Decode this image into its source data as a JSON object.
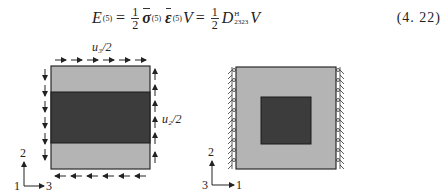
{
  "equation": {
    "lhs": "E",
    "lhs_superscript": "(5)",
    "half_numerator": "1",
    "half_denominator": "2",
    "sigma": "σ",
    "sigma_superscript": "(5)",
    "epsilon": "ε",
    "epsilon_superscript": "(5)",
    "volume": "V",
    "stiffness": "D",
    "stiffness_superscript": "H",
    "stiffness_subscript": "2323",
    "equals": "=",
    "number": "(4. 22)"
  },
  "figure_left": {
    "top_label": "u₃/2",
    "right_label": "u₂/2",
    "axes": {
      "vertical": "2",
      "origin": "1",
      "horizontal": "3"
    },
    "colors": {
      "light": "#b4b4b4",
      "dark": "#3c3c3c",
      "border": "#2a2a2a"
    }
  },
  "figure_right": {
    "axes": {
      "vertical": "2",
      "origin": "3",
      "horizontal": "1"
    },
    "colors": {
      "light": "#b4b4b4",
      "dark": "#3c3c3c",
      "border": "#2a2a2a"
    }
  }
}
